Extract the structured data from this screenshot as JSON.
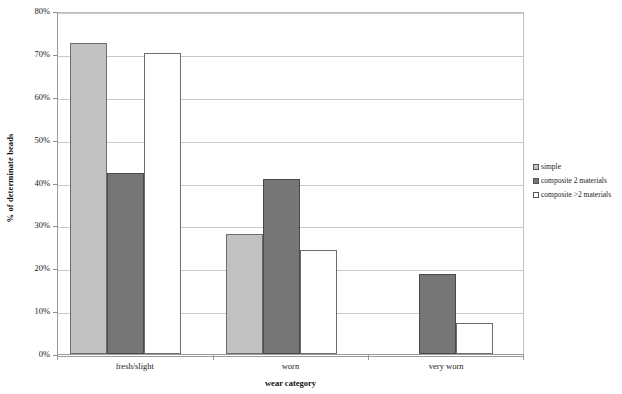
{
  "chart_data": {
    "type": "bar",
    "title": "",
    "subtitle": "",
    "xlabel": "wear category",
    "ylabel": "% of determinate beads",
    "categories": [
      "fresh/slight",
      "worn",
      "very worn"
    ],
    "series": [
      {
        "name": "simple",
        "color": "#c2c2c2",
        "values": [
          72.5,
          28.0,
          0
        ]
      },
      {
        "name": "composite 2 materials",
        "color": "#767676",
        "values": [
          42.3,
          40.8,
          18.6
        ]
      },
      {
        "name": "composite >2 materials",
        "color": "#ffffff",
        "values": [
          70.3,
          24.2,
          7.3
        ]
      }
    ],
    "ylim": [
      0,
      80
    ],
    "ytick_step": 10,
    "ytick_labels": [
      "0%",
      "10%",
      "20%",
      "30%",
      "40%",
      "50%",
      "60%",
      "70%",
      "80%"
    ],
    "ytick_values": [
      0,
      10,
      20,
      30,
      40,
      50,
      60,
      70,
      80
    ],
    "grid": true,
    "grid_axis": "y",
    "legend_position": "right",
    "value_suffix": "%",
    "plot_background": "#ffffff",
    "grid_color": "#c9c9c9",
    "axis_color": "#9a9a9a"
  },
  "legend": {
    "items": [
      {
        "label": "simple",
        "swatch": "legend-swatch-simple"
      },
      {
        "label": "composite 2 materials",
        "swatch": "legend-swatch-composite-2"
      },
      {
        "label": "composite >2 materials",
        "swatch": "legend-swatch-composite-more"
      }
    ]
  }
}
